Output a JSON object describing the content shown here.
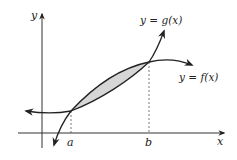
{
  "diagram": {
    "type": "area-between-curves",
    "axes": {
      "x_label": "x",
      "y_label": "y"
    },
    "curves": [
      {
        "name": "g",
        "label": "y = g(x)"
      },
      {
        "name": "f",
        "label": "y = f(x)"
      }
    ],
    "points": [
      {
        "name": "a",
        "label": "a"
      },
      {
        "name": "b",
        "label": "b"
      }
    ],
    "shaded_region": "area between f and g from a to b",
    "colors": {
      "stroke": "#222222",
      "shade": "#d6d6d6",
      "dashed": "#555555"
    }
  }
}
